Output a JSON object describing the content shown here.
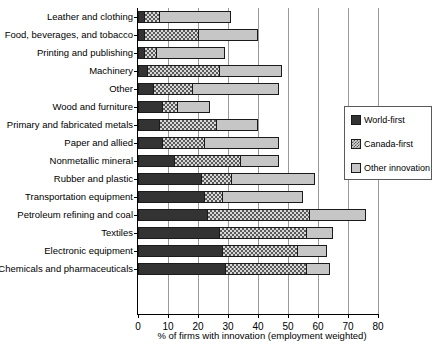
{
  "chart_data": {
    "type": "bar",
    "orientation": "horizontal",
    "stacked": true,
    "title": "",
    "xlabel": "% of firms with innovation (employment weighted)",
    "ylabel": "",
    "xlim": [
      0,
      80
    ],
    "xticks": [
      0,
      10,
      20,
      30,
      40,
      50,
      60,
      70,
      80
    ],
    "xtick_labels": [
      "0",
      "10",
      "20",
      "30",
      "40",
      "50",
      "60",
      "70",
      "80"
    ],
    "grid": "vertical",
    "legend_position": "right",
    "legend": [
      "World-first",
      "Canada-first",
      "Other innovation"
    ],
    "categories": [
      "Leather and clothing",
      "Food, beverages, and tobacco",
      "Printing and publishing",
      "Machinery",
      "Other",
      "Wood and furniture",
      "Primary and fabricated metals",
      "Paper and allied",
      "Nonmetallic mineral",
      "Rubber and plastic",
      "Transportation equipment",
      "Petroleum refining and coal",
      "Textiles",
      "Electronic equipment",
      "Chemicals and pharmaceuticals"
    ],
    "series": [
      {
        "name": "World-first",
        "color": "#333333",
        "values": [
          2,
          2,
          2,
          3,
          5,
          8,
          7,
          8,
          12,
          21,
          22,
          23,
          27,
          28,
          29
        ]
      },
      {
        "name": "Canada-first",
        "color": "#d8d8d8",
        "values": [
          5,
          18,
          4,
          24,
          13,
          5,
          19,
          14,
          22,
          10,
          6,
          34,
          29,
          25,
          27
        ]
      },
      {
        "name": "Other innovation",
        "color": "#c6c6c6",
        "values": [
          24,
          20,
          23,
          21,
          29,
          11,
          14,
          25,
          13,
          28,
          27,
          19,
          9,
          10,
          8
        ]
      }
    ],
    "totals": [
      31,
      40,
      29,
      48,
      47,
      24,
      40,
      47,
      47,
      59,
      55,
      76,
      65,
      63,
      64
    ]
  }
}
